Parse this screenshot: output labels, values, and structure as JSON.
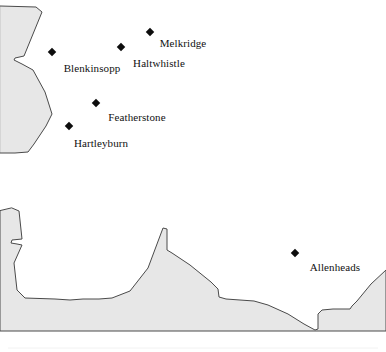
{
  "map": {
    "title": "Northumberland parish locator map",
    "background_color": "#ffffff",
    "land_fill_color": "#e7e7e7",
    "land_outline_color": "#4a4a4a",
    "marker_color": "#0d0d0d",
    "label_color": "#111111",
    "regions": [
      {
        "name": "north-west-land-mass",
        "description": "Upper left shaded area with notched eastern edge",
        "points": "0,6 36,7 42,12 24,56 15,58 14,60 22,64 33,70 45,92 52,114 46,126 34,144 28,152 15,153 0,153"
      },
      {
        "name": "southern-land-mass",
        "description": "Lower shaded band spanning full width with peaks and valleys",
        "points": "12,208 19,211 22,239 12,240 11,243 17,244 22,245 14,263 17,290 25,298 55,299 70,300 83,299 99,299 112,298 130,291 148,268 163,228 167,229 167,250 172,253 190,265 211,282 218,289 219,297 226,299 240,300 254,301 268,305 288,314 304,324 315,330 318,329 318,314 322,310 333,309 350,309 352,306 357,301 371,284 386,270 386,331 0,331 0,211"
      }
    ],
    "baseline": {
      "name": "faint-bottom-rule",
      "y": 348
    },
    "places": [
      {
        "name": "Melkridge",
        "marker_x": 150,
        "marker_y": 32,
        "label_x": 183,
        "label_y": 38
      },
      {
        "name": "Haltwhistle",
        "marker_x": 121,
        "marker_y": 47,
        "label_x": 159,
        "label_y": 58
      },
      {
        "name": "Blenkinsopp",
        "marker_x": 52,
        "marker_y": 52,
        "label_x": 92,
        "label_y": 63
      },
      {
        "name": "Featherstone",
        "marker_x": 96,
        "marker_y": 103,
        "label_x": 137,
        "label_y": 112
      },
      {
        "name": "Hartleyburn",
        "marker_x": 69,
        "marker_y": 126,
        "label_x": 101,
        "label_y": 138
      },
      {
        "name": "Allenheads",
        "marker_x": 295,
        "marker_y": 253,
        "label_x": 335,
        "label_y": 262
      }
    ]
  }
}
